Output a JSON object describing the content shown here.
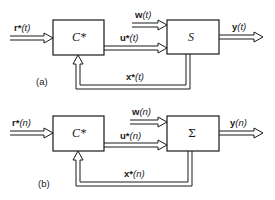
{
  "diagrams": [
    {
      "caption": "(a)",
      "controller": {
        "label": "C*"
      },
      "system": {
        "label": "S"
      },
      "signals": {
        "reference": {
          "name": "r*",
          "arg": "(t)"
        },
        "disturbance": {
          "name": "w",
          "arg": "(t)"
        },
        "control": {
          "name": "u*",
          "arg": "(t)"
        },
        "output": {
          "name": "y",
          "arg": "(t)"
        },
        "state": {
          "name": "x*",
          "arg": "(t)"
        }
      }
    },
    {
      "caption": "(b)",
      "controller": {
        "label": "C*"
      },
      "system": {
        "label": "Σ"
      },
      "signals": {
        "reference": {
          "name": "r*",
          "arg": "(n)"
        },
        "disturbance": {
          "name": "w",
          "arg": "(n)"
        },
        "control": {
          "name": "u*",
          "arg": "(n)"
        },
        "output": {
          "name": "y",
          "arg": "(n)"
        },
        "state": {
          "name": "x*",
          "arg": "(n)"
        }
      }
    }
  ],
  "colors": {
    "line": "#1a1a1a",
    "background": "#ffffff"
  }
}
